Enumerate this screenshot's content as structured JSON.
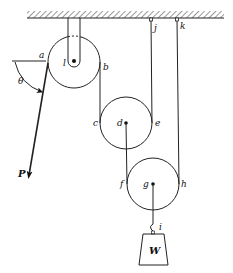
{
  "diagram": {
    "type": "pulley-system",
    "ceiling": {
      "x1": 27,
      "x2": 224,
      "y": 18
    },
    "pulleys": [
      {
        "id": "top",
        "center_label": "l",
        "cx": 74,
        "cy": 62,
        "r": 26,
        "left_label": "a",
        "right_label": "b"
      },
      {
        "id": "middle",
        "center_label": "d",
        "cx": 126,
        "cy": 123,
        "r": 26,
        "left_label": "c",
        "right_label": "e"
      },
      {
        "id": "bottom",
        "center_label": "g",
        "cx": 153,
        "cy": 184,
        "r": 26,
        "left_label": "f",
        "right_label": "h"
      }
    ],
    "anchors": [
      {
        "label": "j",
        "x": 151,
        "y": 19
      },
      {
        "label": "k",
        "x": 177,
        "y": 19
      }
    ],
    "labels": {
      "a": "a",
      "b": "b",
      "c": "c",
      "d": "d",
      "e": "e",
      "f": "f",
      "g": "g",
      "h": "h",
      "i": "i",
      "j": "j",
      "k": "k",
      "l": "l",
      "theta": "θ",
      "force": "P",
      "weight": "W"
    },
    "force": {
      "label": "P",
      "angle_label": "θ"
    },
    "weight": {
      "label": "W",
      "hook_label": "i"
    }
  }
}
